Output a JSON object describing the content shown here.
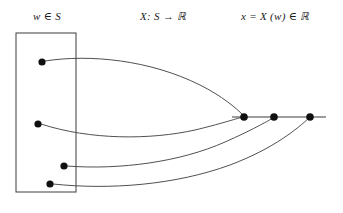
{
  "figure": {
    "title_labels": {
      "domain": {
        "var": "w",
        "rel": "∈",
        "set": "S",
        "full": "w ∈ S"
      },
      "mapping": {
        "map": "X",
        "colon": ":",
        "from": "S",
        "arrow": "→",
        "to": "ℝ",
        "full": "X: S → ℝ"
      },
      "range": {
        "out": "x",
        "eq": "=",
        "map": "X",
        "arg": "(w)",
        "rel": "∈",
        "to": "ℝ",
        "full": "x = X (w) ∈ ℝ"
      }
    },
    "sample_space_box": {
      "name": "S",
      "x": 16,
      "y": 33,
      "width": 60,
      "height": 159,
      "stroke": "#3c3c3c",
      "stroke_width": 1,
      "fill": "none"
    },
    "sample_points": [
      {
        "id": "w1",
        "cx": 42,
        "cy": 62,
        "r": 3.6
      },
      {
        "id": "w2",
        "cx": 38,
        "cy": 124,
        "r": 3.6
      },
      {
        "id": "w3",
        "cx": 64,
        "cy": 166,
        "r": 3.6
      },
      {
        "id": "w4",
        "cx": 50,
        "cy": 184,
        "r": 3.6
      }
    ],
    "real_line": {
      "x1": 232,
      "y1": 117,
      "x2": 326,
      "y2": 117,
      "stroke": "#3c3c3c",
      "stroke_width": 1.2
    },
    "real_points": [
      {
        "id": "x1",
        "cx": 244,
        "cy": 117,
        "r": 3.8
      },
      {
        "id": "x2",
        "cx": 274,
        "cy": 117,
        "r": 3.8
      },
      {
        "id": "x3",
        "cx": 310,
        "cy": 117,
        "r": 3.8
      }
    ],
    "mapping_curves": [
      {
        "id": "w1-to-x1",
        "from": "w1",
        "to": "x1",
        "d": "M 45 61 C 90 54 150 60 200 85 C 222 96 236 108 243 115"
      },
      {
        "id": "w2-to-x1",
        "from": "w2",
        "to": "x1",
        "d": "M 41 124 C 90 140 150 140 195 130 C 220 124 235 119 243 117"
      },
      {
        "id": "w3-to-x2",
        "from": "w3",
        "to": "x2",
        "d": "M 67 166 C 120 170 180 162 225 142 C 252 130 266 122 273 118"
      },
      {
        "id": "w4-to-x3",
        "from": "w4",
        "to": "x3",
        "d": "M 53 184 C 110 190 175 185 230 165 C 275 148 298 128 309 118"
      }
    ],
    "colors": {
      "stroke": "#3c3c3c",
      "dot": "#101010",
      "text": "#1a1a1a",
      "background": "#ffffff"
    }
  }
}
